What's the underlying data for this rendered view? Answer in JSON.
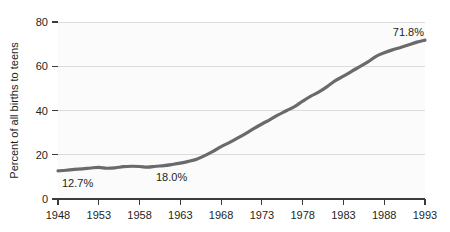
{
  "chart_data": {
    "type": "line",
    "title": "",
    "subtitle": "",
    "xlabel": "",
    "ylabel": "Percent of all births to teens",
    "xlim": [
      1948,
      1993
    ],
    "ylim": [
      0,
      80
    ],
    "grid": true,
    "legend_position": "none",
    "line_color": "#6a6a6a",
    "x_tick_labels": [
      "1948",
      "1953",
      "1958",
      "1963",
      "1968",
      "1973",
      "1978",
      "1983",
      "1988",
      "1993"
    ],
    "x_ticks": [
      1948,
      1953,
      1958,
      1963,
      1968,
      1973,
      1978,
      1983,
      1988,
      1993
    ],
    "y_tick_labels": [
      "0",
      "20",
      "40",
      "60",
      "80"
    ],
    "y_ticks": [
      0,
      20,
      40,
      60,
      80
    ],
    "series": [
      {
        "name": "Percent of all births to teens that were nonmarital",
        "x": [
          1948,
          1949,
          1950,
          1951,
          1952,
          1953,
          1954,
          1955,
          1956,
          1957,
          1958,
          1959,
          1960,
          1961,
          1962,
          1963,
          1964,
          1965,
          1966,
          1967,
          1968,
          1969,
          1970,
          1971,
          1972,
          1973,
          1974,
          1975,
          1976,
          1977,
          1978,
          1979,
          1980,
          1981,
          1982,
          1983,
          1984,
          1985,
          1986,
          1987,
          1988,
          1989,
          1990,
          1991,
          1992,
          1993
        ],
        "values": [
          12.7,
          13.0,
          13.4,
          13.6,
          14.0,
          14.3,
          13.9,
          14.1,
          14.6,
          14.8,
          14.7,
          14.4,
          14.8,
          15.1,
          15.6,
          16.2,
          17.0,
          18.0,
          19.6,
          21.5,
          23.7,
          25.5,
          27.5,
          29.6,
          31.8,
          33.9,
          35.9,
          38.0,
          39.9,
          41.8,
          44.2,
          46.5,
          48.4,
          50.8,
          53.5,
          55.5,
          57.7,
          59.8,
          62.0,
          64.5,
          66.1,
          67.4,
          68.5,
          69.7,
          70.9,
          71.8
        ]
      }
    ],
    "annotations": [
      {
        "label": "12.7%",
        "x": 1948,
        "y": 12.7,
        "position": "below-right"
      },
      {
        "label": "18.0%",
        "x": 1965,
        "y": 18.0,
        "position": "below-right"
      },
      {
        "label": "71.8%",
        "x": 1993,
        "y": 71.8,
        "position": "above-left"
      }
    ]
  }
}
